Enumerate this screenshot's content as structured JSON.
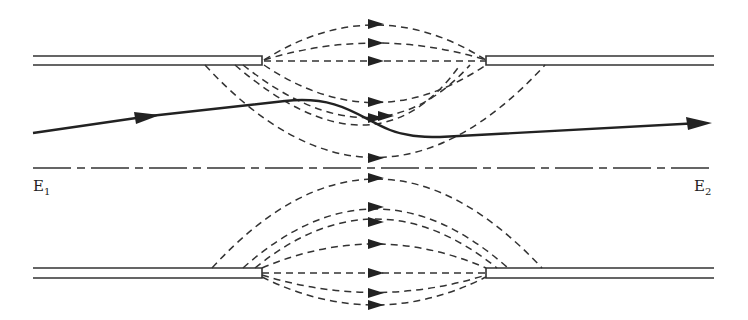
{
  "diagram": {
    "type": "electrostatic-lens-field-lines",
    "labels": {
      "left": {
        "main": "E",
        "sub": "1"
      },
      "right": {
        "main": "E",
        "sub": "2"
      }
    },
    "colors": {
      "stroke": "#222222",
      "background": "#ffffff"
    },
    "elements": {
      "electrodes": [
        "upper-left-plate",
        "upper-right-plate",
        "lower-left-plate",
        "lower-right-plate"
      ],
      "axis": "optical-axis (dash-dot)",
      "field_lines": "dashed with arrowheads pointing right",
      "trajectory": "solid electron path with arrows"
    }
  }
}
